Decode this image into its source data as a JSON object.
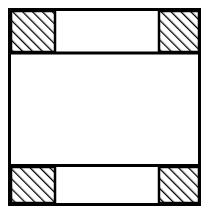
{
  "figure": {
    "title": "Square frame with hatched corner blocks",
    "canvas": {
      "width": 208,
      "height": 214,
      "background_color": "#ffffff"
    },
    "style": {
      "stroke_color": "#000000",
      "fill_color": "#ffffff",
      "hatch_color": "#000000",
      "outer_border_width": 3,
      "inner_line_width": 3,
      "block_border_width": 2.5,
      "hatch_line_width": 2.6,
      "hatch_spacing": 7,
      "hatch_angle_label": "45deg-rising",
      "hatch_direction": "bottom-left to top-right"
    },
    "outer_frame": {
      "label": "outer-square-outline",
      "x": 9.5,
      "y": 9.5,
      "width": 190,
      "height": 195
    },
    "dividers": [
      {
        "label": "upper-divider-line",
        "y": 53,
        "x1": 9.5,
        "x2": 199.5
      },
      {
        "label": "lower-divider-line",
        "y": 165.5,
        "x1": 9.5,
        "x2": 199.5
      }
    ],
    "bands": [
      {
        "label": "top-band",
        "y": 9.5,
        "height": 43.5
      },
      {
        "label": "middle-band",
        "y": 53,
        "height": 112.5
      },
      {
        "label": "bottom-band",
        "y": 165.5,
        "height": 39
      }
    ],
    "hatched_blocks": [
      {
        "label": "top-left-hatched-block",
        "x": 11,
        "y": 11,
        "width": 44,
        "height": 41
      },
      {
        "label": "top-right-hatched-block",
        "x": 159,
        "y": 11,
        "width": 40,
        "height": 41
      },
      {
        "label": "bottom-left-hatched-block",
        "x": 11,
        "y": 167,
        "width": 44,
        "height": 36
      },
      {
        "label": "bottom-right-hatched-block",
        "x": 159,
        "y": 167,
        "width": 40,
        "height": 36
      }
    ],
    "open_blocks": [
      {
        "label": "top-center-open-rectangle",
        "x": 55,
        "y": 11,
        "width": 104,
        "height": 41
      },
      {
        "label": "middle-open-rectangle",
        "x": 11,
        "y": 54.5,
        "width": 188,
        "height": 109.5
      },
      {
        "label": "bottom-center-open-rectangle",
        "x": 55,
        "y": 167,
        "width": 104,
        "height": 36
      }
    ]
  }
}
